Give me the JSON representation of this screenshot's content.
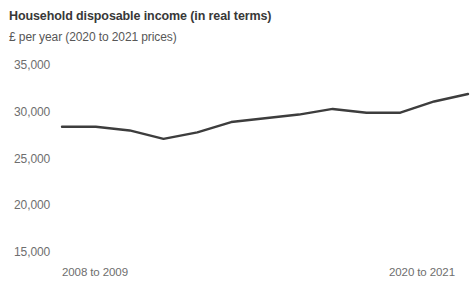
{
  "chart_data": {
    "type": "line",
    "title": "Household disposable income (in real terms)",
    "subtitle": "£ per year (2020 to 2021 prices)",
    "xlabel": "",
    "ylabel": "",
    "ylim": [
      15000,
      35000
    ],
    "ytick_values": [
      35000,
      30000,
      25000,
      20000,
      15000
    ],
    "ytick_labels": [
      "35,000",
      "30,000",
      "25,000",
      "20,000",
      "15,000"
    ],
    "grid": false,
    "legend": "none",
    "line_color": "#3d3d3d",
    "categories": [
      "2008 to 2009",
      "2009 to 2010",
      "2010 to 2011",
      "2011 to 2012",
      "2012 to 2013",
      "2013 to 2014",
      "2014 to 2015",
      "2015 to 2016",
      "2016 to 2017",
      "2017 to 2018",
      "2018 to 2019",
      "2019 to 2020",
      "2020 to 2021"
    ],
    "xtick_labels_shown": [
      "2008 to 2009",
      "2020 to 2021"
    ],
    "values": [
      28400,
      28400,
      28000,
      27100,
      27800,
      28900,
      29300,
      29700,
      30300,
      29900,
      29900,
      31100,
      31900
    ]
  }
}
